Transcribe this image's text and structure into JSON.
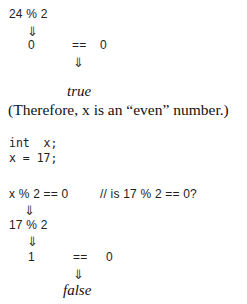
{
  "example1": {
    "expr": "24 % 2",
    "arrow": "⇓",
    "result_left": "0",
    "op": "==",
    "result_right": "0",
    "arrow2": "⇓",
    "outcome": "true",
    "note": "(Therefore, x is an “even” number.)"
  },
  "example2": {
    "decl": "int  x;",
    "assign": "x = 17;",
    "expr": "x % 2 == 0",
    "comment": "// is 17 % 2 == 0?",
    "arrow1": "⇓",
    "substituted": "17 % 2",
    "arrow2": "⇓",
    "result_left": "1",
    "op": "==",
    "result_right": "0",
    "arrow3": "⇓",
    "outcome": "false"
  }
}
